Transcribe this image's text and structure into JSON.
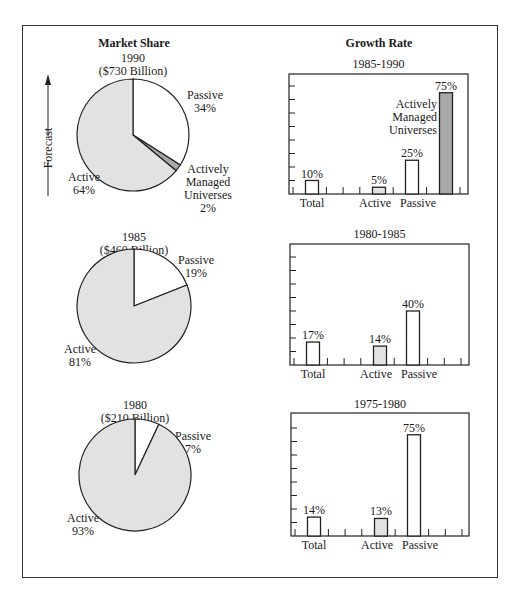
{
  "headers": {
    "market_share": "Market Share",
    "growth_rate": "Growth Rate"
  },
  "forecast_label": "Forecast",
  "colors": {
    "active": "#e2e2e2",
    "passive": "#ffffff",
    "amu": "#a8a8a8",
    "line": "#222222"
  },
  "chart_data": [
    {
      "type": "pie",
      "title": "1990",
      "subtitle": "($730 Billion)",
      "slices": [
        {
          "name": "Passive",
          "value": 34,
          "label": [
            "Passive",
            "34%"
          ]
        },
        {
          "name": "Actively Managed Universes",
          "value": 2,
          "label": [
            "Actively",
            "Managed",
            "Universes",
            "2%"
          ]
        },
        {
          "name": "Active",
          "value": 64,
          "label": [
            "Active",
            "64%"
          ]
        }
      ]
    },
    {
      "type": "bar",
      "title": "1985-1990",
      "ylim": [
        0,
        90
      ],
      "y_ticks_step": 10,
      "categories": [
        "Total",
        "Active",
        "Passive",
        "Actively Managed Universes"
      ],
      "values": [
        10,
        5,
        25,
        75
      ],
      "value_labels": [
        "10%",
        "5%",
        "25%",
        "75%"
      ],
      "xlabels": [
        "Total",
        "Active",
        "Passive",
        ""
      ],
      "annotation": [
        "Actively",
        "Managed",
        "Universes"
      ]
    },
    {
      "type": "pie",
      "title": "1985",
      "subtitle": "($460 Billion)",
      "slices": [
        {
          "name": "Passive",
          "value": 19,
          "label": [
            "Passive",
            "19%"
          ]
        },
        {
          "name": "Active",
          "value": 81,
          "label": [
            "Active",
            "81%"
          ]
        }
      ]
    },
    {
      "type": "bar",
      "title": "1980-1985",
      "ylim": [
        0,
        90
      ],
      "y_ticks_step": 10,
      "categories": [
        "Total",
        "Active",
        "Passive"
      ],
      "values": [
        17,
        14,
        40
      ],
      "value_labels": [
        "17%",
        "14%",
        "40%"
      ],
      "xlabels": [
        "Total",
        "Active",
        "Passive"
      ]
    },
    {
      "type": "pie",
      "title": "1980",
      "subtitle": "($210 Billion)",
      "slices": [
        {
          "name": "Passive",
          "value": 7,
          "label": [
            "Passive",
            "7%"
          ]
        },
        {
          "name": "Active",
          "value": 93,
          "label": [
            "Active",
            "93%"
          ]
        }
      ]
    },
    {
      "type": "bar",
      "title": "1975-1980",
      "ylim": [
        0,
        90
      ],
      "y_ticks_step": 10,
      "categories": [
        "Total",
        "Active",
        "Passive"
      ],
      "values": [
        14,
        13,
        75
      ],
      "value_labels": [
        "14%",
        "13%",
        "75%"
      ],
      "xlabels": [
        "Total",
        "Active",
        "Passive"
      ]
    }
  ]
}
